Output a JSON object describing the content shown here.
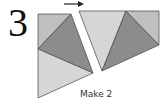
{
  "step": {
    "number": "3",
    "caption": "Make 2"
  },
  "direction_indicator": "arrow-right",
  "colors": {
    "light": "#d6d6d6",
    "medium": "#c0c0c0",
    "dark": "#8c8c8c",
    "stroke": "#444444"
  }
}
